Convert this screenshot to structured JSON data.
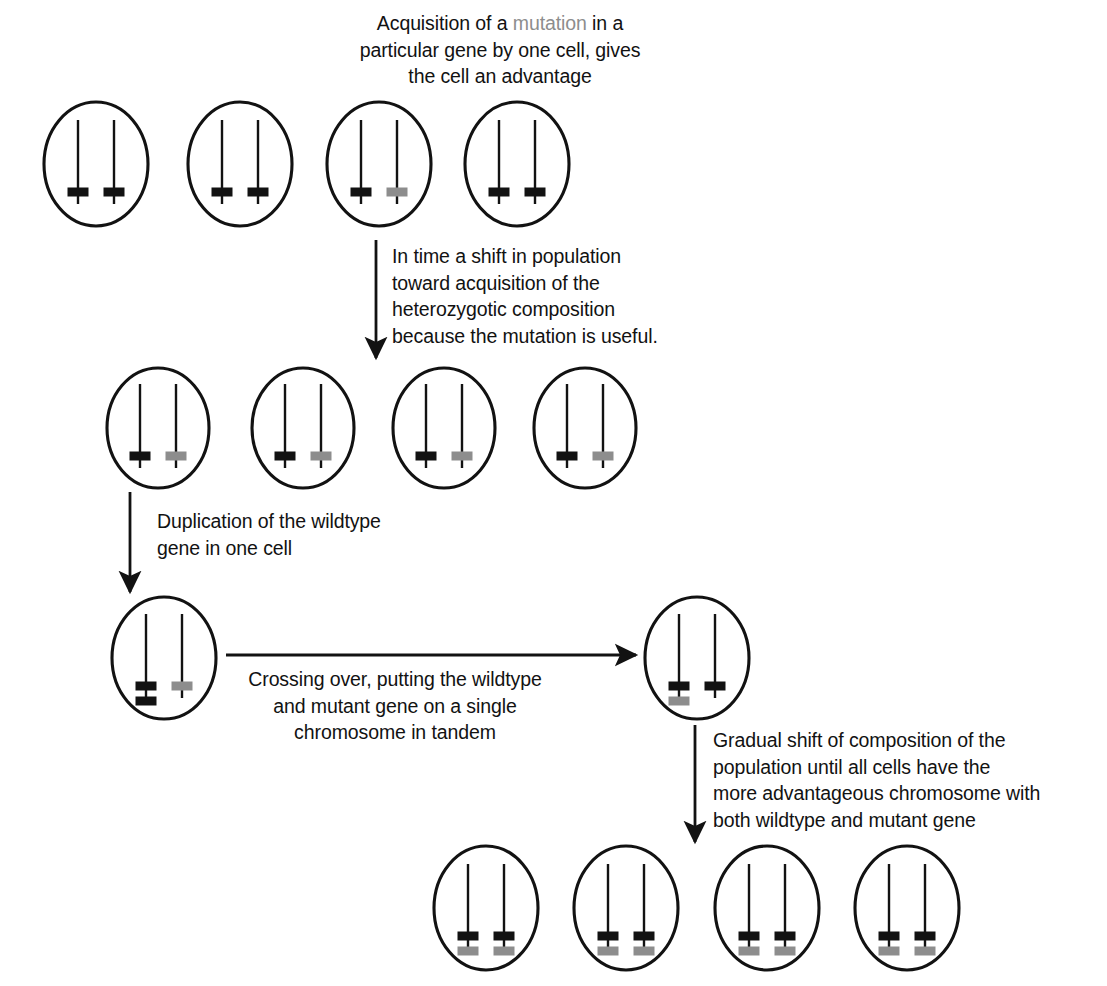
{
  "figure": {
    "background_color": "#ffffff",
    "stroke_color": "#121212",
    "wildtype_gene_color": "#121212",
    "mutant_gene_color": "#8d8d8d"
  },
  "captions": {
    "step1": {
      "text_before": "Acquisition of a ",
      "highlight": "mutation",
      "text_after": " in a\nparticular gene by one cell, gives\nthe cell an advantage",
      "full_text": "Acquisition of a mutation in a particular gene by one cell, gives the cell an advantage",
      "align": "center"
    },
    "step2": {
      "full_text": "In time a shift in population\ntoward acquisition of the\nheterozygotic composition\nbecause the mutation is useful.",
      "align": "left"
    },
    "step3": {
      "full_text": "Duplication of the wildtype\ngene in one cell",
      "align": "left"
    },
    "step4": {
      "full_text": "Crossing over, putting the wildtype\nand mutant gene on a single\nchromosome in tandem",
      "align": "center"
    },
    "step5": {
      "full_text": "Gradual shift of composition of the\npopulation until all cells have the\nmore advantageous chromosome with\nboth wildtype and mutant gene",
      "align": "left"
    }
  },
  "rows": [
    {
      "name": "row-initial-population",
      "cy": 164,
      "rx": 52,
      "ry": 62,
      "cells": [
        {
          "cx": 96,
          "left": [
            "wildtype"
          ],
          "right": [
            "wildtype"
          ]
        },
        {
          "cx": 240,
          "left": [
            "wildtype"
          ],
          "right": [
            "wildtype"
          ]
        },
        {
          "cx": 379,
          "left": [
            "wildtype"
          ],
          "right": [
            "mutant"
          ]
        },
        {
          "cx": 517,
          "left": [
            "wildtype"
          ],
          "right": [
            "wildtype"
          ]
        }
      ]
    },
    {
      "name": "row-heterozygous-population",
      "cy": 428,
      "rx": 51,
      "ry": 60,
      "cells": [
        {
          "cx": 158,
          "left": [
            "wildtype"
          ],
          "right": [
            "mutant"
          ]
        },
        {
          "cx": 303,
          "left": [
            "wildtype"
          ],
          "right": [
            "mutant"
          ]
        },
        {
          "cx": 444,
          "left": [
            "wildtype"
          ],
          "right": [
            "mutant"
          ]
        },
        {
          "cx": 585,
          "left": [
            "wildtype"
          ],
          "right": [
            "mutant"
          ]
        }
      ]
    },
    {
      "name": "row-duplication",
      "cy": 658,
      "rx": 52,
      "ry": 61,
      "cells": [
        {
          "cx": 164,
          "left": [
            "wildtype",
            "wildtype"
          ],
          "right": [
            "mutant"
          ]
        }
      ]
    },
    {
      "name": "row-crossover-product",
      "cy": 658,
      "rx": 52,
      "ry": 61,
      "cells": [
        {
          "cx": 697,
          "left": [
            "wildtype",
            "mutant"
          ],
          "right": [
            "wildtype"
          ]
        }
      ]
    },
    {
      "name": "row-final-population",
      "cy": 908,
      "rx": 52,
      "ry": 62,
      "cells": [
        {
          "cx": 486,
          "left": [
            "wildtype",
            "mutant"
          ],
          "right": [
            "wildtype",
            "mutant"
          ]
        },
        {
          "cx": 626,
          "left": [
            "wildtype",
            "mutant"
          ],
          "right": [
            "wildtype",
            "mutant"
          ]
        },
        {
          "cx": 767,
          "left": [
            "wildtype",
            "mutant"
          ],
          "right": [
            "wildtype",
            "mutant"
          ]
        },
        {
          "cx": 907,
          "left": [
            "wildtype",
            "mutant"
          ],
          "right": [
            "wildtype",
            "mutant"
          ]
        }
      ]
    }
  ],
  "chromosome_geometry": {
    "offset_x": 18,
    "top_offset": -44,
    "bottom_offset": 40,
    "marker_width": 21,
    "marker_height": 9,
    "marker_first_y": 28,
    "marker_gap": 15
  },
  "arrows": [
    {
      "name": "arrow-to-heterozygous",
      "x1": 376,
      "y1": 240,
      "x2": 376,
      "y2": 358,
      "orientation": "vertical"
    },
    {
      "name": "arrow-to-duplication",
      "x1": 130,
      "y1": 492,
      "x2": 130,
      "y2": 592,
      "orientation": "vertical"
    },
    {
      "name": "arrow-crossing-over",
      "x1": 226,
      "y1": 655,
      "x2": 636,
      "y2": 655,
      "orientation": "horizontal"
    },
    {
      "name": "arrow-to-final",
      "x1": 695,
      "y1": 725,
      "x2": 695,
      "y2": 842,
      "orientation": "vertical"
    }
  ],
  "caption_positions": {
    "step1": {
      "left": 305,
      "top": 10,
      "width": 390
    },
    "step2": {
      "left": 392,
      "top": 243,
      "width": 330
    },
    "step3": {
      "left": 157,
      "top": 508,
      "width": 300
    },
    "step4": {
      "left": 243,
      "top": 666,
      "width": 304
    },
    "step5": {
      "left": 713,
      "top": 727,
      "width": 390
    }
  }
}
